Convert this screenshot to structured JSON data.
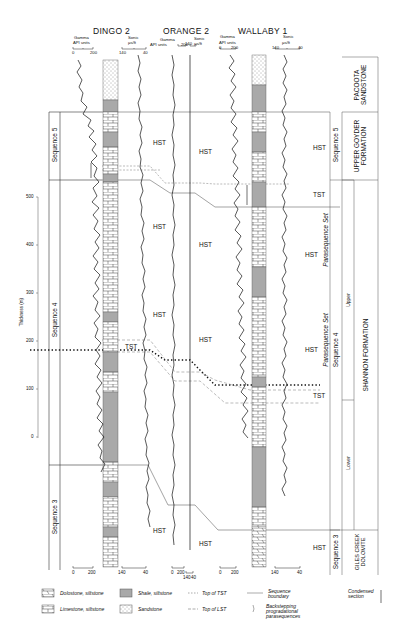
{
  "wells": [
    {
      "name": "DINGO 2",
      "gamma_label": "Gamma",
      "gamma_units": "API units",
      "gamma_range": [
        "0",
        "200"
      ],
      "sonic_label": "Sonic",
      "sonic_units": "µs/ft",
      "sonic_range": [
        "140",
        "40"
      ]
    },
    {
      "name": "ORANGE 2",
      "gamma_label": "Gamma",
      "gamma_units": "API units",
      "gamma_range": [
        "0",
        "200"
      ],
      "sonic_label": "Sonic",
      "sonic_units": "µs/ft",
      "sonic_range": [
        "140",
        "40"
      ]
    },
    {
      "name": "WALLABY 1",
      "gamma_label": "Gamma",
      "gamma_units": "API units",
      "gamma_range": [
        "0",
        "200"
      ],
      "sonic_label": "Sonic",
      "sonic_units": "µs/ft",
      "sonic_range": [
        "140",
        "40"
      ]
    }
  ],
  "thickness_axis": {
    "label": "Thickness (m)",
    "ticks": [
      "500",
      "400",
      "300",
      "200",
      "100",
      "0"
    ]
  },
  "left_sequences": [
    "Sequence 5",
    "Sequence 4",
    "Sequence 3"
  ],
  "systems_tracts": {
    "hst": "HST",
    "tst": "TST",
    "cs": "cs",
    "query": "?"
  },
  "right_columns": {
    "sequences": [
      "Sequence 5",
      "Sequence 4",
      "Sequence 3"
    ],
    "parasequence_sets": [
      "Parasequence Set",
      "Parasequence Set"
    ],
    "members": [
      "Upper",
      "Lower"
    ],
    "formations": [
      "PACOOTA SANDSTONE",
      "UPPER GOYDER FORMATION",
      "SHANNON FORMATION",
      "GILES CREEK DOLOMITE"
    ]
  },
  "bottom_axes": {
    "dingo_gamma": [
      "0",
      "200"
    ],
    "dingo_sonic": [
      "140",
      "40"
    ],
    "orange_gamma": [
      "0",
      "200"
    ],
    "orange_sonic": [
      "140",
      "40"
    ],
    "wallaby_gamma": [
      "0",
      "200"
    ],
    "wallaby_sonic": [
      "140",
      "40"
    ]
  },
  "legend": {
    "dolostone": "Dolostone, siltstone",
    "limestone": "Limestone, siltstone",
    "shale": "Shale, siltstone",
    "sandstone": "Sandstone",
    "top_tst": "Top of TST",
    "top_lst": "Top of LST",
    "sequence_boundary": "Sequence boundary",
    "backstepping": "Backstepping progradational parasequences",
    "condensed": "Condensed section"
  },
  "colors": {
    "ink": "#111111",
    "shale_fill": "#a9a9a9",
    "line_gray": "#777777"
  }
}
